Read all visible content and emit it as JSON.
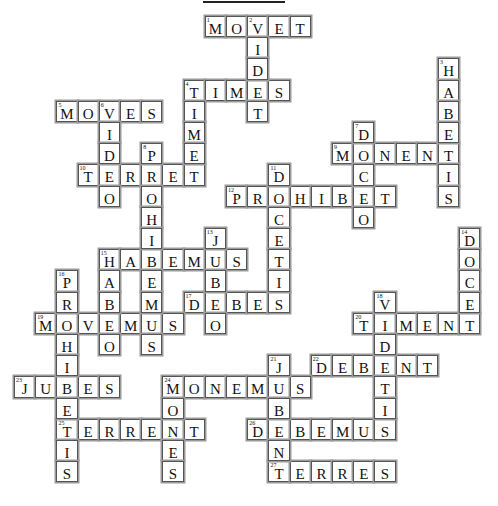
{
  "puzzle": {
    "title_rule": true,
    "grid": {
      "origin_x": 14,
      "origin_y": 16,
      "cell_size": 21.2
    },
    "across": [
      {
        "number": 1,
        "answer": "MOVET",
        "row": 0,
        "col": 9
      },
      {
        "number": 4,
        "answer": "TIMES",
        "row": 3,
        "col": 8
      },
      {
        "number": 5,
        "answer": "MOVES",
        "row": 4,
        "col": 2
      },
      {
        "number": 9,
        "answer": "MONENT",
        "row": 6,
        "col": 15
      },
      {
        "number": 10,
        "answer": "TERRET",
        "row": 7,
        "col": 3
      },
      {
        "number": 12,
        "answer": "PROHIBET",
        "row": 8,
        "col": 10
      },
      {
        "number": 15,
        "answer": "HABEMUS",
        "row": 11,
        "col": 4
      },
      {
        "number": 17,
        "answer": "DEBES",
        "row": 13,
        "col": 8
      },
      {
        "number": 19,
        "answer": "MOVEMUS",
        "row": 14,
        "col": 1
      },
      {
        "number": 20,
        "answer": "TIMENT",
        "row": 14,
        "col": 16
      },
      {
        "number": 22,
        "answer": "DEBENT",
        "row": 16,
        "col": 14
      },
      {
        "number": 23,
        "answer": "JUBES",
        "row": 17,
        "col": 0
      },
      {
        "number": 24,
        "answer": "MONEMUS",
        "row": 17,
        "col": 7
      },
      {
        "number": 25,
        "answer": "TERRENT",
        "row": 19,
        "col": 2
      },
      {
        "number": 26,
        "answer": "DEBEMUS",
        "row": 19,
        "col": 11
      },
      {
        "number": 27,
        "answer": "TERRES",
        "row": 21,
        "col": 12
      }
    ],
    "down": [
      {
        "number": 2,
        "answer": "VIDET",
        "row": 0,
        "col": 11
      },
      {
        "number": 3,
        "answer": "HABETIS",
        "row": 2,
        "col": 20
      },
      {
        "number": 4,
        "answer": "TIMET",
        "row": 3,
        "col": 8
      },
      {
        "number": 6,
        "answer": "VIDEO",
        "row": 4,
        "col": 4
      },
      {
        "number": 7,
        "answer": "DOCEO",
        "row": 5,
        "col": 16
      },
      {
        "number": 8,
        "answer": "PROHIBEMUS",
        "row": 6,
        "col": 6
      },
      {
        "number": 11,
        "answer": "DOCETIS",
        "row": 7,
        "col": 12
      },
      {
        "number": 13,
        "answer": "JUBEO",
        "row": 10,
        "col": 9
      },
      {
        "number": 14,
        "answer": "DOCET",
        "row": 10,
        "col": 21
      },
      {
        "number": 15,
        "answer": "HABEO",
        "row": 11,
        "col": 4
      },
      {
        "number": 16,
        "answer": "PROHIBETIS",
        "row": 12,
        "col": 2
      },
      {
        "number": 18,
        "answer": "VIDETIS",
        "row": 13,
        "col": 17
      },
      {
        "number": 21,
        "answer": "JUBENT",
        "row": 16,
        "col": 12
      },
      {
        "number": 24,
        "answer": "MONES",
        "row": 17,
        "col": 7
      }
    ]
  }
}
